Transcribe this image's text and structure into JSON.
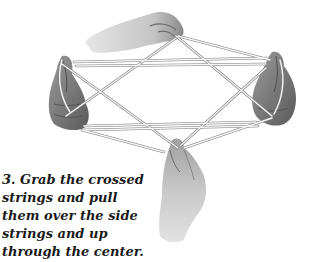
{
  "figure": {
    "step_number": "3.",
    "caption_lines": [
      "3. Grab the crossed",
      "strings and pull",
      "them over the side",
      "strings and up",
      "through the center."
    ],
    "colors": {
      "background": "#ffffff",
      "text": "#1a1a1a",
      "skin_light": "#d8d8d8",
      "skin_mid": "#a8a8a8",
      "skin_dark": "#6e6e6e",
      "string": "#f4f4f4",
      "string_outline": "#7a7a7a"
    }
  }
}
